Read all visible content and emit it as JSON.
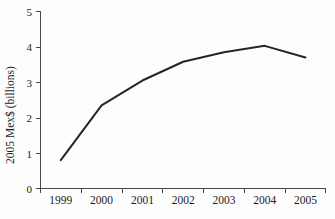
{
  "chart_data": {
    "type": "line",
    "title": "",
    "subtitle": "",
    "xlabel": "",
    "ylabel": "2005 Mex$ (billions)",
    "categories": [
      "1999",
      "2000",
      "2001",
      "2002",
      "2003",
      "2004",
      "2005"
    ],
    "x": [
      1999,
      2000,
      2001,
      2002,
      2003,
      2004,
      2005
    ],
    "values": [
      0.8,
      2.35,
      3.05,
      3.58,
      3.85,
      4.03,
      3.7
    ],
    "series": [
      {
        "name": "2005 Mex$ (billions)",
        "values": [
          0.8,
          2.35,
          3.05,
          3.58,
          3.85,
          4.03,
          3.7
        ],
        "color": "#262626"
      }
    ],
    "ylim": [
      0,
      5
    ],
    "yticks": [
      0,
      1,
      2,
      3,
      4,
      5
    ],
    "ytick_labels": [
      "0",
      "1",
      "2",
      "3",
      "4",
      "5"
    ],
    "xtick_labels": [
      "1999",
      "2000",
      "2001",
      "2002",
      "2003",
      "2004",
      "2005"
    ],
    "grid": false,
    "legend": false,
    "legend_position": "none",
    "markers": false,
    "line_color": "#262626",
    "axis_color": "#4a4a4a",
    "background_color": "#fdfdfd"
  },
  "axes": {
    "y_title": "2005 Mex$ (billions)",
    "y_ticks": [
      {
        "label": "5",
        "value": 5
      },
      {
        "label": "4",
        "value": 4
      },
      {
        "label": "3",
        "value": 3
      },
      {
        "label": "2",
        "value": 2
      },
      {
        "label": "1",
        "value": 1
      },
      {
        "label": "0",
        "value": 0
      }
    ],
    "x_ticks": [
      {
        "label": "1999",
        "value": 1999
      },
      {
        "label": "2000",
        "value": 2000
      },
      {
        "label": "2001",
        "value": 2001
      },
      {
        "label": "2002",
        "value": 2002
      },
      {
        "label": "2003",
        "value": 2003
      },
      {
        "label": "2004",
        "value": 2004
      },
      {
        "label": "2005",
        "value": 2005
      }
    ]
  }
}
